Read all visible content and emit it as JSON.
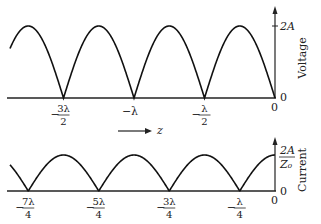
{
  "chart_data": [
    {
      "type": "line",
      "title": "Voltage standing wave",
      "ylabel": "Voltage",
      "xlabel": "z",
      "y_ticks": [
        "0",
        "2A"
      ],
      "x_ticks": [
        {
          "num": "3λ",
          "den": "2",
          "sign": "−",
          "x": -1.5
        },
        {
          "num": "λ",
          "den": "",
          "sign": "−",
          "x": -1.0
        },
        {
          "num": "λ",
          "den": "2",
          "sign": "−",
          "x": -0.5
        },
        {
          "num": "0",
          "den": "",
          "sign": "",
          "x": 0
        }
      ],
      "description": "|sin| shaped arches, zeros at z = -3λ/2, -λ, -λ/2, 0; peak 2A",
      "zeros": [
        -1.5,
        -1.0,
        -0.5,
        0
      ],
      "peak": "2A"
    },
    {
      "type": "line",
      "title": "Current standing wave",
      "ylabel": "Current",
      "y_ticks": [
        "0",
        "2A/Z0"
      ],
      "x_ticks": [
        {
          "num": "7λ",
          "den": "4",
          "sign": "−",
          "x": -1.75
        },
        {
          "num": "5λ",
          "den": "4",
          "sign": "−",
          "x": -1.25
        },
        {
          "num": "3λ",
          "den": "4",
          "sign": "−",
          "x": -0.75
        },
        {
          "num": "λ",
          "den": "4",
          "sign": "−",
          "x": -0.25
        },
        {
          "num": "0",
          "den": "",
          "sign": "",
          "x": 0
        }
      ],
      "description": "|cos| shaped arches, zeros at z = -7λ/4, -5λ/4, -3λ/4, -λ/4; peak 2A/Z0 at z=0",
      "zeros": [
        -1.75,
        -1.25,
        -0.75,
        -0.25
      ],
      "peak": "2A/Z0"
    }
  ],
  "labels": {
    "voltage_axis": "Voltage",
    "current_axis": "Current",
    "v_peak": "2A",
    "i_peak_num": "2A",
    "i_peak_den": "Z₀",
    "zero": "0",
    "z_label": "z",
    "v_ticks": [
      {
        "sign": "−",
        "num": "3λ",
        "den": "2"
      },
      {
        "sign": "−",
        "num": "λ",
        "den": ""
      },
      {
        "sign": "−",
        "num": "λ",
        "den": "2"
      }
    ],
    "i_ticks": [
      {
        "sign": "−",
        "num": "7λ",
        "den": "4"
      },
      {
        "sign": "−",
        "num": "5λ",
        "den": "4"
      },
      {
        "sign": "−",
        "num": "3λ",
        "den": "4"
      },
      {
        "sign": "−",
        "num": "λ",
        "den": "4"
      }
    ]
  }
}
